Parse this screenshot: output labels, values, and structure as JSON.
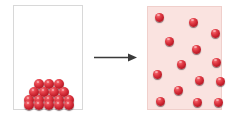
{
  "diagram": {
    "background_color": "#ffffff",
    "width": 231,
    "height": 115
  },
  "left_container": {
    "name": "solid-state-container",
    "label": "",
    "fill_color": "#ffffff",
    "border_color": "#d8d8d8",
    "state": "packed",
    "particle_count": 17,
    "particle_color": "#c41f2c",
    "particles": [
      {
        "x": 20,
        "y": 73,
        "d": 10
      },
      {
        "x": 30,
        "y": 73,
        "d": 10
      },
      {
        "x": 40,
        "y": 73,
        "d": 10
      },
      {
        "x": 15,
        "y": 81,
        "d": 10
      },
      {
        "x": 25,
        "y": 81,
        "d": 10
      },
      {
        "x": 35,
        "y": 81,
        "d": 10
      },
      {
        "x": 45,
        "y": 81,
        "d": 10
      },
      {
        "x": 10,
        "y": 89,
        "d": 10
      },
      {
        "x": 20,
        "y": 89,
        "d": 10
      },
      {
        "x": 30,
        "y": 89,
        "d": 10
      },
      {
        "x": 40,
        "y": 89,
        "d": 10
      },
      {
        "x": 50,
        "y": 89,
        "d": 10
      },
      {
        "x": 10,
        "y": 94,
        "d": 10
      },
      {
        "x": 20,
        "y": 94,
        "d": 10
      },
      {
        "x": 30,
        "y": 94,
        "d": 10
      },
      {
        "x": 40,
        "y": 94,
        "d": 10
      },
      {
        "x": 50,
        "y": 94,
        "d": 10
      }
    ]
  },
  "arrow": {
    "name": "transition-arrow",
    "direction": "right",
    "color": "#3a3a3a",
    "label": ""
  },
  "right_container": {
    "name": "dispersed-state-container",
    "label": "",
    "fill_color": "#fae3e0",
    "border_color": "#f0cfcb",
    "state": "dispersed",
    "particle_count": 14,
    "particle_color": "#c41f2c",
    "particles": [
      {
        "x": 7,
        "y": 6,
        "d": 9
      },
      {
        "x": 41,
        "y": 11,
        "d": 9
      },
      {
        "x": 63,
        "y": 22,
        "d": 9
      },
      {
        "x": 17,
        "y": 30,
        "d": 9
      },
      {
        "x": 44,
        "y": 38,
        "d": 9
      },
      {
        "x": 29,
        "y": 53,
        "d": 9
      },
      {
        "x": 64,
        "y": 51,
        "d": 9
      },
      {
        "x": 5,
        "y": 63,
        "d": 9
      },
      {
        "x": 47,
        "y": 69,
        "d": 9
      },
      {
        "x": 68,
        "y": 70,
        "d": 9
      },
      {
        "x": 26,
        "y": 79,
        "d": 9
      },
      {
        "x": 8,
        "y": 90,
        "d": 9
      },
      {
        "x": 45,
        "y": 91,
        "d": 9
      },
      {
        "x": 66,
        "y": 91,
        "d": 9
      }
    ]
  }
}
